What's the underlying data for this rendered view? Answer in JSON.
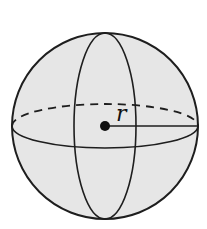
{
  "diagram": {
    "shape": "sphere",
    "radius_label": "r",
    "colors": {
      "fill": "#e6e6e6",
      "stroke": "#1e1e1e",
      "background": "#ffffff"
    },
    "elements": [
      {
        "name": "outer-circle",
        "type": "circle"
      },
      {
        "name": "vertical-great-circle",
        "type": "ellipse",
        "style": "solid"
      },
      {
        "name": "equator-back",
        "type": "arc",
        "style": "dashed"
      },
      {
        "name": "equator-front",
        "type": "arc",
        "style": "solid"
      },
      {
        "name": "center-point",
        "type": "dot"
      },
      {
        "name": "radius-line",
        "type": "line"
      }
    ]
  }
}
